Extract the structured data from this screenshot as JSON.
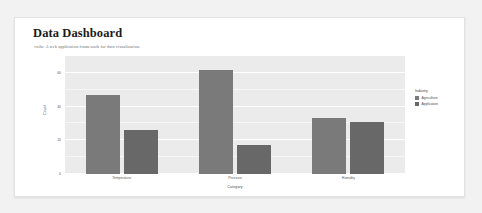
{
  "page": {
    "background_color": "#f2f2f2",
    "card_background": "#ffffff",
    "title": "Data Dashboard",
    "subtitle": "voila: A web application framework for data visualization."
  },
  "chart_data": {
    "type": "bar",
    "title": "",
    "xlabel": "Category",
    "ylabel": "Count",
    "categories": [
      "Temperature",
      "Pressure",
      "Humidity"
    ],
    "series": [
      {
        "name": "Agriculture",
        "color": "#7a7a7a",
        "values": [
          47,
          62,
          33
        ]
      },
      {
        "name": "Application",
        "color": "#686868",
        "values": [
          26,
          17,
          31
        ]
      }
    ],
    "ylim": [
      0,
      70
    ],
    "yticks": [
      0,
      20,
      40,
      60
    ],
    "ytick_labels": [
      "0",
      "20",
      "40",
      "60"
    ],
    "grid": true,
    "panel_background": "#ebebeb",
    "legend_title": "Industry",
    "legend_position": "right"
  }
}
